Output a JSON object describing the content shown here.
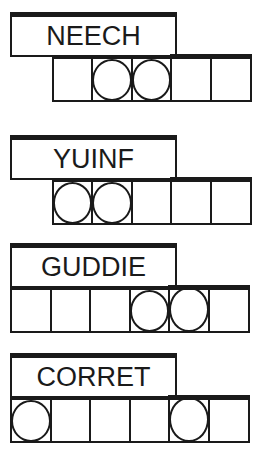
{
  "puzzle_type": "word-jumble",
  "colors": {
    "ink": "#1a1a1a",
    "background": "#ffffff"
  },
  "puzzles": [
    {
      "scrambled": "NEECH",
      "letter_count": 5,
      "cells_offset": 1,
      "circled_positions": [
        2,
        3
      ]
    },
    {
      "scrambled": "YUINF",
      "letter_count": 5,
      "cells_offset": 1,
      "circled_positions": [
        1,
        2
      ]
    },
    {
      "scrambled": "GUDDIE",
      "letter_count": 6,
      "cells_offset": 0,
      "circled_positions": [
        4,
        5
      ]
    },
    {
      "scrambled": "CORRET",
      "letter_count": 6,
      "cells_offset": 0,
      "circled_positions": [
        1,
        5
      ]
    }
  ]
}
